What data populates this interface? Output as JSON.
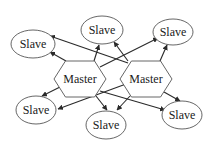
{
  "diagram": {
    "type": "master-slave network",
    "colors": {
      "stroke": "#555555",
      "edge": "#2a2a2a",
      "text": "#1a1a1a",
      "background": "#ffffff"
    },
    "masters": [
      {
        "id": "m1",
        "label": "Master",
        "cx": 80,
        "cy": 79,
        "w": 52,
        "h": 36
      },
      {
        "id": "m2",
        "label": "Master",
        "cx": 146,
        "cy": 79,
        "w": 52,
        "h": 36
      }
    ],
    "slaves": [
      {
        "id": "s1",
        "label": "Slave",
        "cx": 33,
        "cy": 44,
        "rx": 22,
        "ry": 14
      },
      {
        "id": "s2",
        "label": "Slave",
        "cx": 102,
        "cy": 30,
        "rx": 21,
        "ry": 14
      },
      {
        "id": "s3",
        "label": "Slave",
        "cx": 173,
        "cy": 32,
        "rx": 20,
        "ry": 13
      },
      {
        "id": "s4",
        "label": "Slave",
        "cx": 36,
        "cy": 110,
        "rx": 20,
        "ry": 14
      },
      {
        "id": "s5",
        "label": "Slave",
        "cx": 106,
        "cy": 125,
        "rx": 20,
        "ry": 14
      },
      {
        "id": "s6",
        "label": "Slave",
        "cx": 182,
        "cy": 115,
        "rx": 20,
        "ry": 14
      }
    ],
    "edges": [
      {
        "from": "m1",
        "to": "s1",
        "x1": 66,
        "y1": 61,
        "x2": 50,
        "y2": 52
      },
      {
        "from": "m1",
        "to": "s2",
        "x1": 94,
        "y1": 61,
        "x2": 99,
        "y2": 45
      },
      {
        "from": "m1",
        "to": "s3",
        "x1": 100,
        "y1": 67,
        "x2": 158,
        "y2": 38
      },
      {
        "from": "m1",
        "to": "s4",
        "x1": 62,
        "y1": 86,
        "x2": 42,
        "y2": 96
      },
      {
        "from": "m1",
        "to": "s5",
        "x1": 96,
        "y1": 96,
        "x2": 107,
        "y2": 110
      },
      {
        "from": "m1",
        "to": "s6",
        "x1": 100,
        "y1": 91,
        "x2": 165,
        "y2": 110
      },
      {
        "from": "m2",
        "to": "s1",
        "x1": 128,
        "y1": 63,
        "x2": 50,
        "y2": 36
      },
      {
        "from": "m2",
        "to": "s2",
        "x1": 128,
        "y1": 61,
        "x2": 114,
        "y2": 42
      },
      {
        "from": "m2",
        "to": "s3",
        "x1": 160,
        "y1": 61,
        "x2": 167,
        "y2": 45
      },
      {
        "from": "m2",
        "to": "s4",
        "x1": 126,
        "y1": 84,
        "x2": 58,
        "y2": 109
      },
      {
        "from": "m2",
        "to": "s5",
        "x1": 130,
        "y1": 96,
        "x2": 117,
        "y2": 110
      },
      {
        "from": "m2",
        "to": "s6",
        "x1": 164,
        "y1": 92,
        "x2": 180,
        "y2": 101
      }
    ]
  }
}
